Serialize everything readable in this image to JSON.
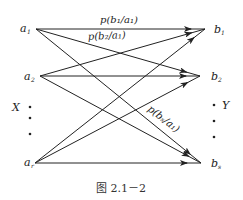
{
  "diagram": {
    "type": "discrete-channel-transition",
    "source_set_label": "X",
    "sink_set_label": "Y",
    "inputs": [
      {
        "id": "a1",
        "label": "a",
        "sub": "1",
        "x": 36,
        "y": 29
      },
      {
        "id": "a2",
        "label": "a",
        "sub": "2",
        "x": 40,
        "y": 76
      },
      {
        "id": "ar",
        "label": "a",
        "sub": "r",
        "x": 35,
        "y": 163
      }
    ],
    "outputs": [
      {
        "id": "b1",
        "label": "b",
        "sub": "1",
        "x": 205,
        "y": 29
      },
      {
        "id": "b2",
        "label": "b",
        "sub": "2",
        "x": 200,
        "y": 76
      },
      {
        "id": "bs",
        "label": "b",
        "sub": "s",
        "x": 201,
        "y": 163
      }
    ],
    "edges": [
      {
        "from": "a1",
        "to": "b1"
      },
      {
        "from": "a1",
        "to": "b2"
      },
      {
        "from": "a1",
        "to": "bs"
      },
      {
        "from": "a2",
        "to": "b1"
      },
      {
        "from": "a2",
        "to": "b2"
      },
      {
        "from": "a2",
        "to": "bs"
      },
      {
        "from": "ar",
        "to": "b1"
      },
      {
        "from": "ar",
        "to": "b2"
      },
      {
        "from": "ar",
        "to": "bs"
      }
    ],
    "edge_labels": [
      {
        "text": "p(b₁/a₁)",
        "edge": "a1-b1"
      },
      {
        "text": "p(b₂/a₁)",
        "edge": "a1-b2"
      },
      {
        "text": "p(bₛ/a₁)",
        "edge": "a1-bs"
      }
    ],
    "caption": "图 2.1－2"
  }
}
